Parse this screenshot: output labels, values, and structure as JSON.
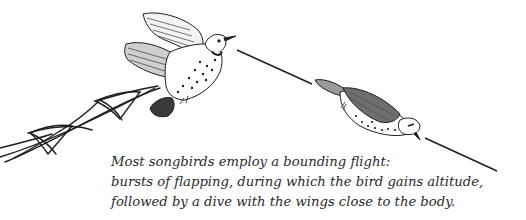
{
  "illustration": {
    "subject": "bounding flight of songbirds",
    "elements": [
      {
        "name": "flight-path-zigzag",
        "description": "undulating flight path with loops"
      },
      {
        "name": "bird-flapping",
        "description": "spotted songbird with wings raised, flapping and gaining altitude"
      },
      {
        "name": "bird-diving",
        "description": "spotted songbird with wings folded, diving"
      }
    ]
  },
  "caption": {
    "lines": [
      "Most songbirds employ a bounding flight:",
      "bursts of flapping, during which the bird gains altitude,",
      "followed by a dive with the wings close to the body."
    ]
  },
  "colors": {
    "ink": "#1f1f1f",
    "background": "#ffffff"
  }
}
